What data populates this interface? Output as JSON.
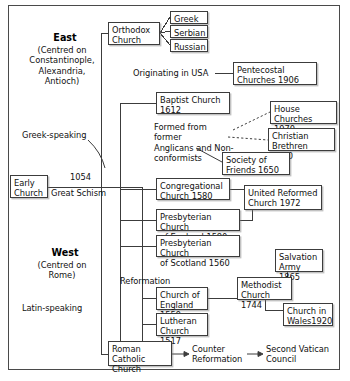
{
  "diagram": {
    "frame": {
      "border_color": "#4a4a4a"
    },
    "regions": [
      {
        "id": "east",
        "title": "East",
        "subtitle": "(Centred on\nConstantinople,\nAlexandria,\nAntioch)",
        "language": "Greek-speaking"
      },
      {
        "id": "west",
        "title": "West",
        "subtitle": "(Centred on\nRome)",
        "language": "Latin-speaking"
      }
    ],
    "boxes": [
      {
        "id": "early-church",
        "label": "Early\nChurch"
      },
      {
        "id": "orthodox-church",
        "label": "Orthodox\nChurch"
      },
      {
        "id": "greek",
        "label": "Greek"
      },
      {
        "id": "serbian",
        "label": "Serbian"
      },
      {
        "id": "russian",
        "label": "Russian"
      },
      {
        "id": "pentecostal-churches",
        "label": "Pentecostal\nChurches 1906"
      },
      {
        "id": "baptist-church",
        "label": "Baptist Church\n1612"
      },
      {
        "id": "house-churches",
        "label": "House Churches\n1970"
      },
      {
        "id": "christian-brethren",
        "label": "Christian\nBrethren 1830"
      },
      {
        "id": "society-of-friends",
        "label": "Society of\nFriends 1650"
      },
      {
        "id": "congregational-church",
        "label": "Congregational\nChurch 1580"
      },
      {
        "id": "united-reformed-church",
        "label": "United Reformed\nChurch 1972"
      },
      {
        "id": "presbyterian-england",
        "label": "Presbyterian Church\nof England 1580"
      },
      {
        "id": "presbyterian-scotland",
        "label": "Presbyterian Church\nof Scotland 1560"
      },
      {
        "id": "salvation-army",
        "label": "Salvation\nArmy 1865"
      },
      {
        "id": "methodist-church",
        "label": "Methodist\nChurch 1744"
      },
      {
        "id": "church-of-england",
        "label": "Church of\nEngland 1559"
      },
      {
        "id": "church-in-wales",
        "label": "Church in\nWales1920"
      },
      {
        "id": "lutheran-church",
        "label": "Lutheran\nChurch 1517"
      },
      {
        "id": "roman-catholic-church",
        "label": "Roman Catholic\nChurch"
      }
    ],
    "labels": [
      {
        "id": "great-schism-year",
        "text": "1054"
      },
      {
        "id": "great-schism",
        "text": "Great Schism"
      },
      {
        "id": "originating-in-usa",
        "text": "Originating in USA"
      },
      {
        "id": "formed-from-former",
        "text": "Formed from former\nAnglicans and Non-\nconformists"
      },
      {
        "id": "reformation",
        "text": "Reformation"
      },
      {
        "id": "counter-reformation",
        "text": "Counter\nReformation"
      },
      {
        "id": "second-vatican-council",
        "text": "Second Vatican\nCouncil"
      }
    ]
  }
}
